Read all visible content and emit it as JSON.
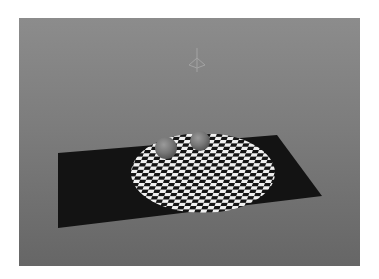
{
  "viewport": {
    "label": "3D render viewport",
    "background_top": "#8c8c8c",
    "background_bottom": "#666666"
  },
  "scene": {
    "objects": [
      {
        "name": "ground-plane",
        "color": "#121212"
      },
      {
        "name": "checkered-disc",
        "colors": [
          "#f2f2f2",
          "#151515"
        ]
      },
      {
        "name": "sphere-left",
        "color": "#7a7a7a"
      },
      {
        "name": "sphere-right",
        "color": "#7a7a7a"
      },
      {
        "name": "light-gizmo",
        "icon": "spot-light-icon"
      }
    ]
  }
}
